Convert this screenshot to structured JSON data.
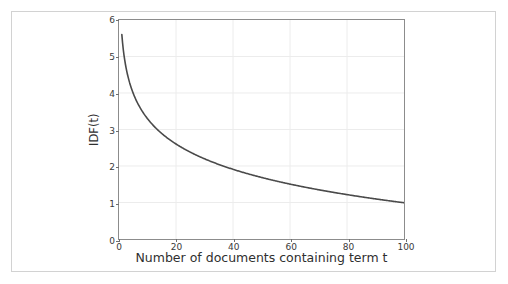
{
  "figure": {
    "background_color": "#ffffff",
    "frame_color": "#d2d2d2",
    "axes_color": "#8c8c8c",
    "grid_color": "#ececec",
    "curve_color": "#4a4a4a",
    "tick_label_color": "#3a3a3a",
    "axis_title_color": "#2f2f2f"
  },
  "chart_data": {
    "type": "line",
    "title": "",
    "subtitle": "",
    "xlabel": "Number of documents containing term t",
    "ylabel": "IDF(t)",
    "xlim": [
      0,
      100
    ],
    "ylim": [
      0,
      6
    ],
    "xticks": [
      0,
      20,
      40,
      60,
      80,
      100
    ],
    "xtick_labels": [
      "0",
      "20",
      "40",
      "60",
      "80",
      "100"
    ],
    "yticks": [
      0,
      1,
      2,
      3,
      4,
      5,
      6
    ],
    "ytick_labels": [
      "0",
      "1",
      "2",
      "3",
      "4",
      "5",
      "6"
    ],
    "grid": true,
    "legend": null,
    "legend_position": "none",
    "annotations": [],
    "series": [
      {
        "name": "IDF(t)",
        "color": "#4a4a4a",
        "linewidth": 1.6,
        "formula": "IDF(t) = ln(N / t), N = 270",
        "x": [
          1,
          2,
          3,
          4,
          5,
          6,
          7,
          8,
          9,
          10,
          12,
          14,
          16,
          18,
          20,
          25,
          30,
          35,
          40,
          45,
          50,
          55,
          60,
          65,
          70,
          75,
          80,
          85,
          90,
          95,
          100
        ],
        "y": [
          5.6,
          4.91,
          4.5,
          4.22,
          3.99,
          3.81,
          3.65,
          3.52,
          3.4,
          3.3,
          3.12,
          2.96,
          2.82,
          2.71,
          2.6,
          2.38,
          2.2,
          2.04,
          1.91,
          1.79,
          1.69,
          1.59,
          1.5,
          1.42,
          1.35,
          1.28,
          1.22,
          1.16,
          1.1,
          1.05,
          1.0
        ]
      }
    ]
  }
}
